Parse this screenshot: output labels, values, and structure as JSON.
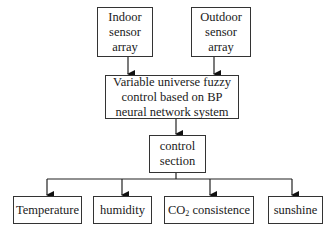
{
  "diagram": {
    "inputs": [
      {
        "id": "indoor",
        "lines": [
          "Indoor",
          "sensor",
          "array"
        ]
      },
      {
        "id": "outdoor",
        "lines": [
          "Outdoor",
          "sensor",
          "array"
        ]
      }
    ],
    "processor": {
      "lines": [
        "Variable universe fuzzy",
        "control based on BP",
        "neural network system"
      ]
    },
    "control": {
      "lines": [
        "control",
        "section"
      ]
    },
    "outputs": [
      {
        "id": "temperature",
        "label": "Temperature"
      },
      {
        "id": "humidity",
        "label": "humidity"
      },
      {
        "id": "co2",
        "label_prefix": "CO",
        "label_sub": "2",
        "label_suffix": " consistence"
      },
      {
        "id": "sunshine",
        "label": "sunshine"
      }
    ],
    "edges": [
      [
        "indoor",
        "processor"
      ],
      [
        "outdoor",
        "processor"
      ],
      [
        "processor",
        "control"
      ],
      [
        "control",
        "temperature"
      ],
      [
        "control",
        "humidity"
      ],
      [
        "control",
        "co2"
      ],
      [
        "control",
        "sunshine"
      ]
    ]
  }
}
